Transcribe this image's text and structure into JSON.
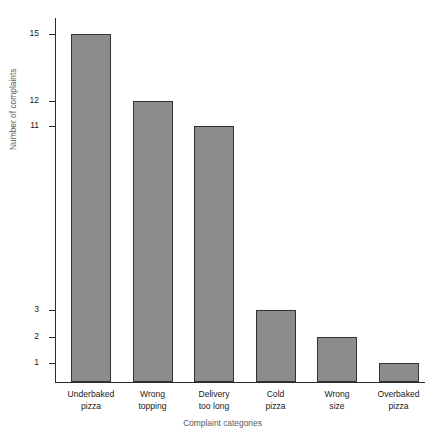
{
  "chart_data": {
    "type": "bar",
    "title": "",
    "subtitle": "",
    "xlabel": "Complaint categories",
    "ylabel": "Number of complaints",
    "categories": [
      "Underbaked pizza",
      "Wrong topping",
      "Delivery too long",
      "Cold pizza",
      "Wrong size",
      "Overbaked pizza"
    ],
    "category_lines": [
      [
        "Underbaked",
        "pizza"
      ],
      [
        "Wrong",
        "topping"
      ],
      [
        "Delivery",
        "too long"
      ],
      [
        "Cold",
        "pizza"
      ],
      [
        "Wrong",
        "size"
      ],
      [
        "Overbaked",
        "pizza"
      ]
    ],
    "values": [
      15,
      12,
      11,
      3,
      2,
      1
    ],
    "ytick_labels": [
      "15",
      "12",
      "11",
      "3",
      "2",
      "1"
    ],
    "ytick_values": [
      15,
      12,
      11,
      3,
      2,
      1
    ],
    "ylim": [
      0,
      15
    ],
    "grid": false,
    "legend": null,
    "bar_color": "#8c8c8c",
    "bar_edge_color": "#333333",
    "axis_color": "#2b2b2b",
    "background_color": "#ffffff",
    "axis_label_color": "#5a5a5a",
    "tick_label_color": "#1a1a1a",
    "note": "Broken non-linear y-axis: ticks 15,12,11 near top and 3,2,1 near bottom"
  },
  "geometry": {
    "plot_left": 55,
    "plot_right": 425,
    "baseline_y": 382,
    "axis_top_y": 18,
    "bar_width": 40,
    "bar_slot_width": 61.5,
    "first_bar_left": 71,
    "tick_y_positions": [
      34,
      101,
      126,
      310,
      337,
      363
    ]
  }
}
